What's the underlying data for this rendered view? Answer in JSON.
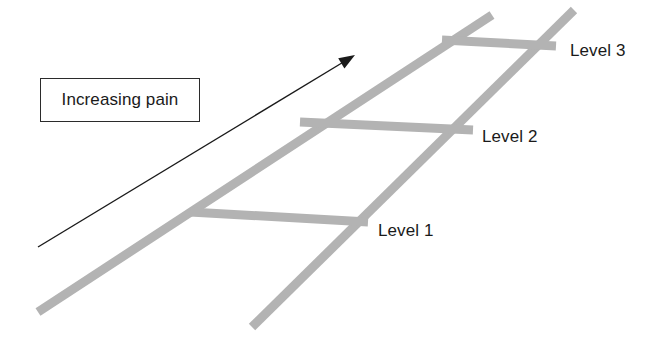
{
  "figure": {
    "type": "ladder-diagram",
    "background_color": "#ffffff",
    "rail_color": "#b3b3b3",
    "rung_color": "#b3b3b3",
    "arrow_color": "#1a1a1a",
    "text_color": "#1a1a1a",
    "box_border_color": "#2b2b2b"
  },
  "callout": {
    "label": "Increasing pain"
  },
  "ladder": {
    "rails": [
      {
        "name": "left-rail",
        "x1": 38,
        "y1": 312,
        "x2": 492,
        "y2": 15,
        "width": 9
      },
      {
        "name": "right-rail",
        "x1": 252,
        "y1": 327,
        "x2": 574,
        "y2": 10,
        "width": 9
      }
    ],
    "rungs": [
      {
        "name": "rung-level-1",
        "label": "Level 1",
        "x1": 190,
        "y1": 212,
        "x2": 368,
        "y2": 222,
        "width": 9
      },
      {
        "name": "rung-level-2",
        "label": "Level 2",
        "x1": 300,
        "y1": 122,
        "x2": 473,
        "y2": 130,
        "width": 9
      },
      {
        "name": "rung-level-3",
        "label": "Level 3",
        "x1": 442,
        "y1": 40,
        "x2": 556,
        "y2": 46,
        "width": 9
      }
    ]
  },
  "labels": {
    "level_1": "Level 1",
    "level_2": "Level 2",
    "level_3": "Level 3"
  },
  "arrow": {
    "name": "increasing-pain-arrow",
    "tail_x": 38,
    "tail_y": 247,
    "tip_x": 355,
    "tip_y": 55,
    "stroke_width": 1.4,
    "head_length": 16,
    "head_width": 12
  }
}
